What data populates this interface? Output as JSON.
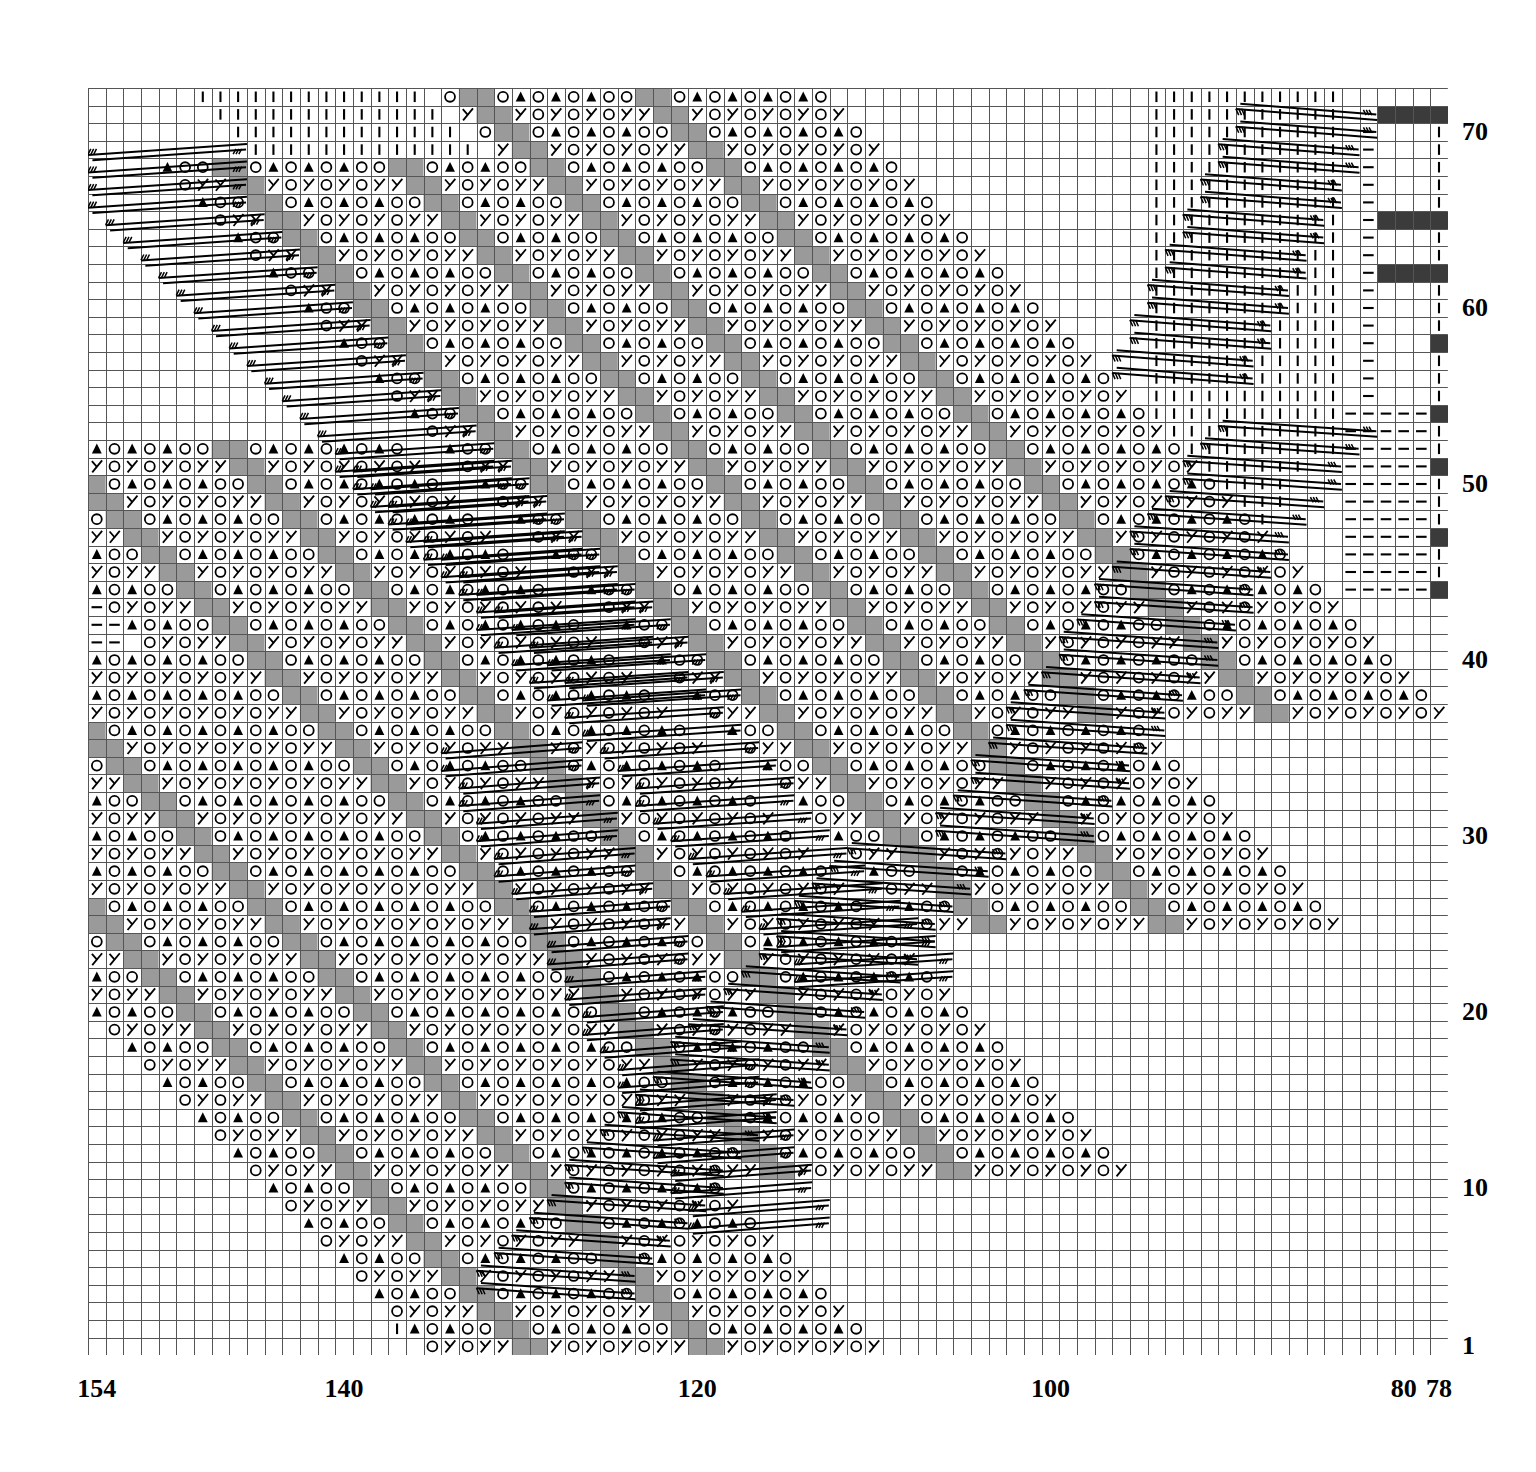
{
  "chart_data": {
    "type": "table",
    "grid": {
      "columns": 77,
      "rows": 72,
      "cell_px": 17.66,
      "row_px": 17.6
    },
    "xlabel": "",
    "ylabel": "",
    "x_axis": {
      "name": "stitch-number-axis",
      "direction": "right-to-left",
      "ticks": [
        {
          "label": "154",
          "col": 0
        },
        {
          "label": "140",
          "col": 14
        },
        {
          "label": "120",
          "col": 34
        },
        {
          "label": "100",
          "col": 54
        },
        {
          "label": "80",
          "col": 74
        },
        {
          "label": "78",
          "col": 76
        }
      ]
    },
    "y_axis": {
      "name": "row-number-axis",
      "direction": "bottom-to-top",
      "ticks": [
        {
          "label": "1",
          "row": 1
        },
        {
          "label": "10",
          "row": 10
        },
        {
          "label": "20",
          "row": 20
        },
        {
          "label": "30",
          "row": 30
        },
        {
          "label": "40",
          "row": 40
        },
        {
          "label": "50",
          "row": 50
        },
        {
          "label": "60",
          "row": 60
        },
        {
          "label": "70",
          "row": 70
        }
      ]
    },
    "colors": {
      "grid_line": "#555555",
      "cell_blank": "#ffffff",
      "cell_gray": "#9a9a9a",
      "cell_black": "#3b3b3b",
      "symbol": "#000000",
      "label": "#000000"
    },
    "symbols": {
      "O": {
        "name": "yarn-over",
        "glyph": "O"
      },
      "K": {
        "name": "left-slanting-decrease",
        "glyph": "⤴"
      },
      "T": {
        "name": "filled-triangle-decrease",
        "glyph": "▲"
      },
      "I": {
        "name": "knit-stitch-bar",
        "glyph": "|"
      },
      "D": {
        "name": "purl-dash",
        "glyph": "—"
      },
      "G": {
        "name": "gray-no-stitch",
        "glyph": ""
      },
      "B": {
        "name": "black-marker",
        "glyph": ""
      },
      "C": {
        "name": "cable-cross-start",
        "glyph": ""
      },
      "c": {
        "name": "cable-cross-end",
        "glyph": ""
      },
      "y": {
        "name": "yarn-over-with-cable",
        "glyph": ""
      }
    },
    "legend": [
      {
        "key": "O",
        "label": "yarn over"
      },
      {
        "key": "K",
        "label": "left-slanting decrease"
      },
      {
        "key": "T",
        "label": "double decrease"
      },
      {
        "key": "I",
        "label": "knit"
      },
      {
        "key": "D",
        "label": "purl"
      },
      {
        "key": "G",
        "label": "no stitch"
      },
      {
        "key": "B",
        "label": "marker"
      },
      {
        "key": "C",
        "label": "cable cross"
      }
    ],
    "motif": {
      "description": "Diagonal leaf/feather lace motifs repeating on a bias with cable crossing travelling lines",
      "repeat_unit_cols": 20,
      "repeat_unit_rows": 20,
      "band_count": 4,
      "bias_slope": 1.0
    },
    "cells": {
      "encoding": "row:col-run pairs, rows counted 1 (bottom) to 72 (top), cols counted 0 (left,=154) to 76 (right,=78)",
      "note": "Pattern generated procedurally from motif geometry: four diagonal lace bands of paired O/decrease columns separated by gray no-stitch columns, bounded by cable travelling lines, with knit-bar and purl-dash fill outside the bands and black marker cells along the right margin."
    },
    "black_marker_rows": [
      71,
      65,
      62,
      58,
      54,
      51,
      47,
      44
    ],
    "right_margin_dash_rows": [
      54,
      53,
      52,
      51,
      50,
      49,
      48,
      47,
      46,
      45,
      44
    ]
  }
}
